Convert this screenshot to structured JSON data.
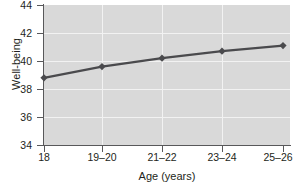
{
  "chart_data": {
    "type": "line",
    "title": "",
    "xlabel": "Age (years)",
    "ylabel": "Well-being",
    "categories": [
      "18",
      "19–20",
      "21–22",
      "23–24",
      "25–26"
    ],
    "values": [
      38.8,
      39.6,
      40.2,
      40.7,
      41.1
    ],
    "series": [
      {
        "name": "Well-being",
        "values": [
          38.8,
          39.6,
          40.2,
          40.7,
          41.1
        ]
      }
    ],
    "ylim": [
      34,
      44
    ],
    "yticks": [
      34,
      36,
      38,
      40,
      42,
      44
    ],
    "ytick_labels": [
      "34",
      "36",
      "38",
      "40",
      "42",
      "44"
    ],
    "xtick_labels": [
      "18",
      "19–20",
      "21–22",
      "23–24",
      "25–26"
    ],
    "grid": true,
    "legend": false,
    "legend_position": "none",
    "marker": "diamond",
    "colors": {
      "line": "#4a4a4d",
      "marker": "#4a4a4d",
      "plot_background": "#d9d9d9",
      "gridline": "#f2f2f2",
      "axis": "#58585a",
      "text": "#231f20",
      "page_background": "#ffffff"
    }
  }
}
